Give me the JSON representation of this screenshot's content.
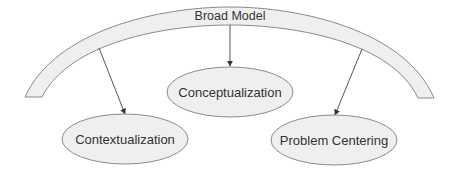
{
  "diagram": {
    "colors": {
      "stroke": "#8a8a8a",
      "fill": "#efefef",
      "arrow": "#333333",
      "text": "#333333",
      "background": "#ffffff"
    },
    "arc": {
      "label": "Broad Model"
    },
    "nodes": [
      {
        "id": "conceptualization",
        "label": "Conceptualization"
      },
      {
        "id": "contextualization",
        "label": "Contextualization"
      },
      {
        "id": "problem-centering",
        "label": "Problem Centering"
      }
    ],
    "edges": [
      {
        "from": "Broad Model",
        "to": "Conceptualization"
      },
      {
        "from": "Broad Model",
        "to": "Contextualization"
      },
      {
        "from": "Broad Model",
        "to": "Problem Centering"
      }
    ]
  }
}
